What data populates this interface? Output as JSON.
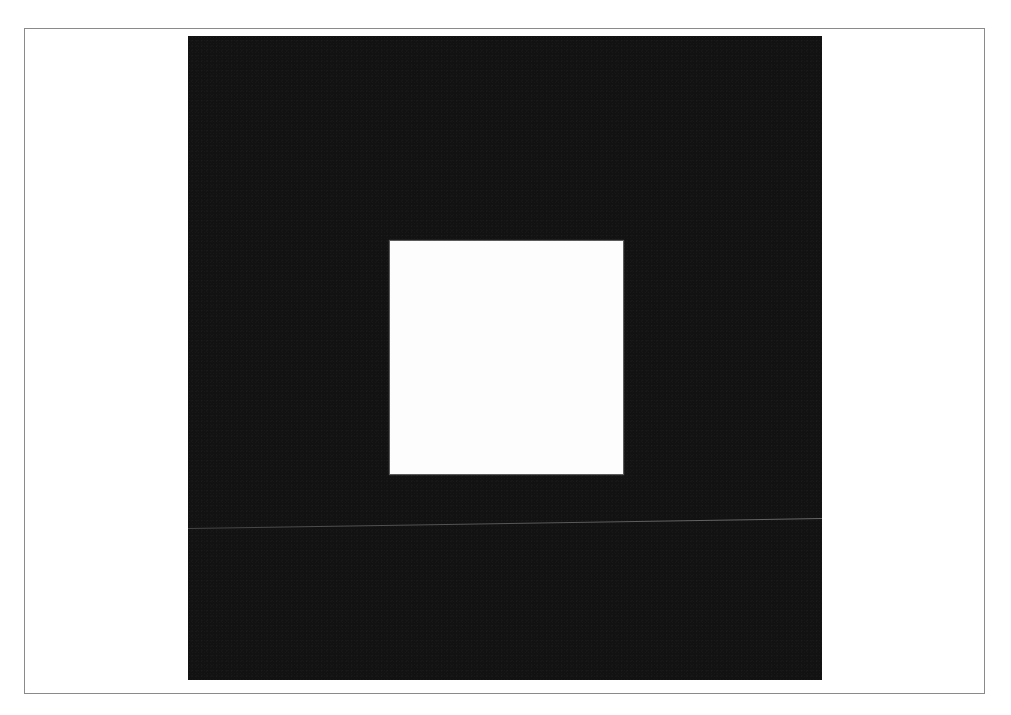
{
  "figure": {
    "colors": {
      "page_background": "#ffffff",
      "frame_border": "#8a8a8a",
      "panel_fill": "#121212",
      "inner_square_fill": "#fdfdfd",
      "horizontal_line": "#7a7a7a"
    },
    "elements": [
      {
        "name": "outer-frame",
        "type": "rectangle-outline"
      },
      {
        "name": "black-panel",
        "type": "filled-rectangle"
      },
      {
        "name": "white-square",
        "type": "filled-rectangle"
      },
      {
        "name": "horizontal-line",
        "type": "line"
      }
    ]
  }
}
